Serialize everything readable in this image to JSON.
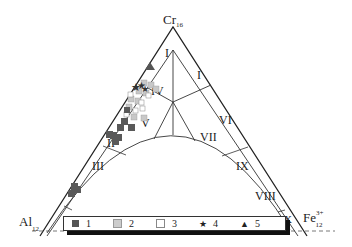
{
  "diagram": {
    "type": "ternary",
    "vertices": {
      "top": {
        "label": "Cr",
        "subscript": "16"
      },
      "left": {
        "label": "Al",
        "subscript": "12"
      },
      "right": {
        "label": "Fe",
        "superscript": "3+",
        "subscript": "12"
      }
    },
    "fields": [
      "I",
      "I",
      "IV",
      "V",
      "II",
      "III",
      "VI",
      "VII",
      "IX",
      "VIII",
      "X"
    ],
    "legend": [
      {
        "label": "1",
        "symbol": "square-dark",
        "color": "#555555"
      },
      {
        "label": "2",
        "symbol": "square-light-gray",
        "color": "#bbbbbb"
      },
      {
        "label": "3",
        "symbol": "square-open",
        "color": "#ffffff"
      },
      {
        "label": "4",
        "symbol": "star",
        "color": "#333333"
      },
      {
        "label": "5",
        "symbol": "triangle",
        "color": "#444444"
      }
    ]
  }
}
